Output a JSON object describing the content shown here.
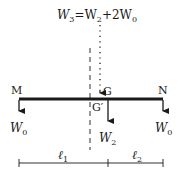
{
  "diagram": {
    "formula": {
      "lhs": "W",
      "lhs_sub": "3",
      "eq": "=W",
      "mid_sub": "2",
      "plus": "+2W",
      "end_sub": "0"
    },
    "points": {
      "left_end": "M",
      "right_end": "N",
      "center_g": "G",
      "center_g_prime": "G′"
    },
    "forces": {
      "left": {
        "label": "W",
        "sub": "0"
      },
      "middle": {
        "label": "W",
        "sub": "2"
      },
      "right": {
        "label": "W",
        "sub": "0"
      }
    },
    "dimensions": {
      "left": {
        "label": "ℓ",
        "sub": "1"
      },
      "right": {
        "label": "ℓ",
        "sub": "2"
      }
    },
    "colors": {
      "ink": "#1a1a1a",
      "background": "#ffffff"
    }
  }
}
